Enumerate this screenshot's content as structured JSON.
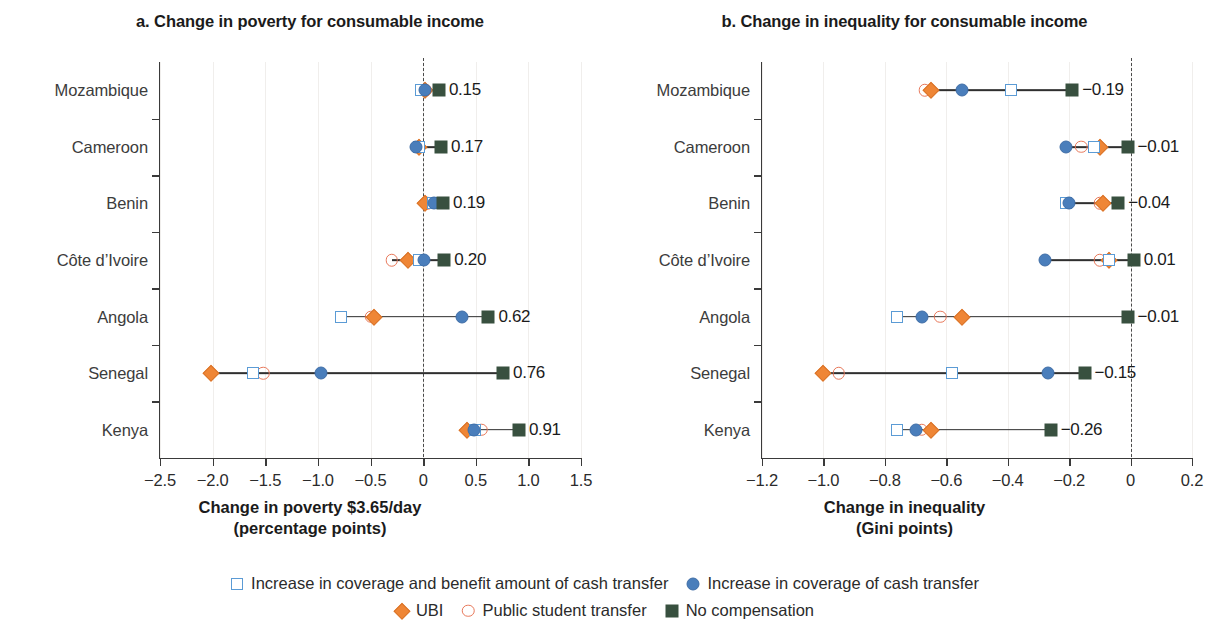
{
  "chart_data": {
    "type": "scatter",
    "layout": "two-panel dumbbell / dot plot, horizontal",
    "grid": "light vertical gridlines, dashed zero reference line",
    "legend_position": "bottom-center",
    "series_names": [
      "Increase in coverage and benefit amount of cash transfer",
      "Increase in coverage of cash transfer",
      "UBI",
      "Public student transfer",
      "No compensation"
    ],
    "series_markers": [
      "open-square-blue",
      "filled-circle-blue",
      "filled-diamond-orange",
      "open-circle-orange",
      "filled-square-green"
    ],
    "categories": [
      "Mozambique",
      "Cameroon",
      "Benin",
      "Côte d’Ivoire",
      "Angola",
      "Senegal",
      "Kenya"
    ],
    "panels": [
      {
        "title": "a. Change in poverty for consumable income",
        "xlabel_line1": "Change in poverty $3.65/day",
        "xlabel_line2": "(percentage points)",
        "xlim": [
          -2.5,
          1.5
        ],
        "xticks": [
          -2.5,
          -2.0,
          -1.5,
          -1.0,
          -0.5,
          0,
          0.5,
          1.0,
          1.5
        ],
        "xtick_labels": [
          "−2.5",
          "−2.0",
          "−1.5",
          "−1.0",
          "−0.5",
          "0",
          "0.5",
          "1.0",
          "1.5"
        ],
        "rows": [
          {
            "category": "Mozambique",
            "label": "0.15",
            "values": {
              "increase_coverage_benefit": -0.02,
              "increase_coverage": 0.02,
              "ubi": 0.02,
              "public_student_transfer": 0.02,
              "no_compensation": 0.15
            }
          },
          {
            "category": "Cameroon",
            "label": "0.17",
            "values": {
              "increase_coverage_benefit": -0.04,
              "increase_coverage": -0.07,
              "ubi": -0.04,
              "public_student_transfer": -0.04,
              "no_compensation": 0.17
            }
          },
          {
            "category": "Benin",
            "label": "0.19",
            "values": {
              "increase_coverage_benefit": 0.09,
              "increase_coverage": 0.1,
              "ubi": 0.02,
              "public_student_transfer": 0.04,
              "no_compensation": 0.19
            }
          },
          {
            "category": "Côte d’Ivoire",
            "label": "0.20",
            "values": {
              "increase_coverage_benefit": -0.04,
              "increase_coverage": 0.01,
              "ubi": -0.14,
              "public_student_transfer": -0.3,
              "no_compensation": 0.2
            }
          },
          {
            "category": "Angola",
            "label": "0.62",
            "values": {
              "increase_coverage_benefit": -0.78,
              "increase_coverage": 0.37,
              "ubi": -0.47,
              "public_student_transfer": -0.5,
              "no_compensation": 0.62
            }
          },
          {
            "category": "Senegal",
            "label": "0.76",
            "values": {
              "increase_coverage_benefit": -1.62,
              "increase_coverage": -0.97,
              "ubi": -2.02,
              "public_student_transfer": -1.52,
              "no_compensation": 0.76
            }
          },
          {
            "category": "Kenya",
            "label": "0.91",
            "values": {
              "increase_coverage_benefit": 0.49,
              "increase_coverage": 0.48,
              "ubi": 0.42,
              "public_student_transfer": 0.55,
              "no_compensation": 0.91
            }
          }
        ]
      },
      {
        "title": "b. Change in inequality for consumable income",
        "xlabel_line1": "Change in inequality",
        "xlabel_line2": "(Gini points)",
        "xlim": [
          -1.2,
          0.2
        ],
        "xticks": [
          -1.2,
          -1.0,
          -0.8,
          -0.6,
          -0.4,
          -0.2,
          0,
          0.2
        ],
        "xtick_labels": [
          "−1.2",
          "−1.0",
          "−0.8",
          "−0.6",
          "−0.4",
          "−0.2",
          "0",
          "0.2"
        ],
        "rows": [
          {
            "category": "Mozambique",
            "label": "−0.19",
            "values": {
              "increase_coverage_benefit": -0.39,
              "increase_coverage": -0.55,
              "ubi": -0.65,
              "public_student_transfer": -0.67,
              "no_compensation": -0.19
            }
          },
          {
            "category": "Cameroon",
            "label": "−0.01",
            "values": {
              "increase_coverage_benefit": -0.12,
              "increase_coverage": -0.21,
              "ubi": -0.1,
              "public_student_transfer": -0.16,
              "no_compensation": -0.01
            }
          },
          {
            "category": "Benin",
            "label": "−0.04",
            "values": {
              "increase_coverage_benefit": -0.21,
              "increase_coverage": -0.2,
              "ubi": -0.09,
              "public_student_transfer": -0.1,
              "no_compensation": -0.04
            }
          },
          {
            "category": "Côte d’Ivoire",
            "label": "0.01",
            "values": {
              "increase_coverage_benefit": -0.07,
              "increase_coverage": -0.28,
              "ubi": -0.07,
              "public_student_transfer": -0.1,
              "no_compensation": 0.01
            }
          },
          {
            "category": "Angola",
            "label": "−0.01",
            "values": {
              "increase_coverage_benefit": -0.76,
              "increase_coverage": -0.68,
              "ubi": -0.55,
              "public_student_transfer": -0.62,
              "no_compensation": -0.01
            }
          },
          {
            "category": "Senegal",
            "label": "−0.15",
            "values": {
              "increase_coverage_benefit": -0.58,
              "increase_coverage": -0.27,
              "ubi": -1.0,
              "public_student_transfer": -0.95,
              "no_compensation": -0.15
            }
          },
          {
            "category": "Kenya",
            "label": "−0.26",
            "values": {
              "increase_coverage_benefit": -0.76,
              "increase_coverage": -0.7,
              "ubi": -0.65,
              "public_student_transfer": -0.68,
              "no_compensation": -0.26
            }
          }
        ]
      }
    ]
  },
  "colors": {
    "open_square_blue": "#5b9bd5",
    "filled_circle_blue": "#4a7ebb",
    "diamond_orange": "#ef8636",
    "open_circle_orange": "#e8785a",
    "filled_square_green": "#38503f",
    "connector": "#2f2f2f",
    "axis": "#3a3a3a",
    "gridline": "#f0eeec"
  }
}
